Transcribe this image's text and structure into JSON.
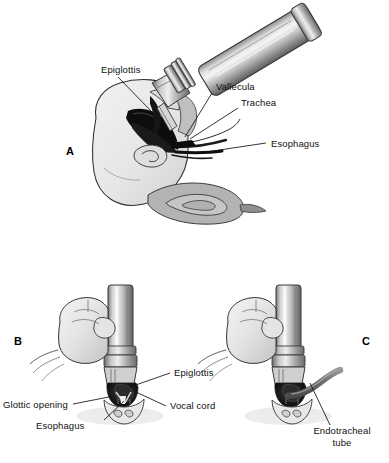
{
  "figure": {
    "background_color": "#ffffff",
    "ink_color": "#111111",
    "skin_fill": "#e9e9e9",
    "tongue_fill": "#a9a9a9",
    "metal_light": "#f2f2f2",
    "metal_mid": "#b5b5b5",
    "metal_dark": "#6e6e6e",
    "cavity_dark": "#111111",
    "tube_fill": "#6f6f6f",
    "shadow_fill": "#d8d8d8"
  },
  "panels": [
    {
      "letter": "A",
      "name": "sagittal-laryngoscopy-view",
      "labels": [
        {
          "id": "epiglottis",
          "text": "Epiglottis"
        },
        {
          "id": "vallecula",
          "text": "Vallecula"
        },
        {
          "id": "trachea",
          "text": "Trachea"
        },
        {
          "id": "esophagus",
          "text": "Esophagus"
        }
      ]
    },
    {
      "letter": "B",
      "name": "glottic-view-no-tube",
      "labels": [
        {
          "id": "epiglottis",
          "text": "Epiglottis"
        },
        {
          "id": "glottic_opening",
          "text": "Glottic opening"
        },
        {
          "id": "vocal_cord",
          "text": "Vocal cord"
        },
        {
          "id": "esophagus",
          "text": "Esophagus"
        }
      ]
    },
    {
      "letter": "C",
      "name": "glottic-view-with-tube",
      "labels": [
        {
          "id": "endotracheal_tube_line1",
          "text": "Endotracheal"
        },
        {
          "id": "endotracheal_tube_line2",
          "text": "tube"
        }
      ]
    }
  ],
  "panel_a": {
    "letter": "A",
    "label_epiglottis": "Epiglottis",
    "label_vallecula": "Vallecula",
    "label_trachea": "Trachea",
    "label_esophagus": "Esophagus"
  },
  "panel_b": {
    "letter": "B",
    "label_epiglottis": "Epiglottis",
    "label_glottic_opening": "Glottic opening",
    "label_vocal_cord": "Vocal cord",
    "label_esophagus": "Esophagus"
  },
  "panel_c": {
    "letter": "C",
    "label_endotracheal_line1": "Endotracheal",
    "label_endotracheal_line2": "tube"
  },
  "caption": {
    "cut_off_text": ""
  }
}
